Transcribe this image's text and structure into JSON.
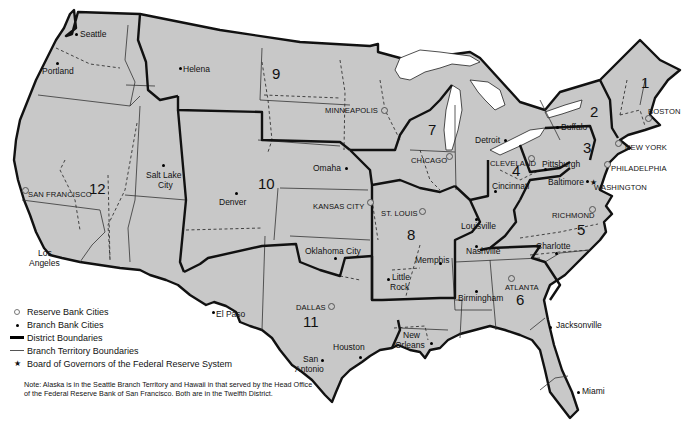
{
  "map": {
    "title": "Federal Reserve Districts",
    "fill_color": "#c8c8c8",
    "boundary_color": "#111111",
    "districts": [
      {
        "number": "1",
        "reserve_bank": "BOSTON"
      },
      {
        "number": "2",
        "reserve_bank": "NEW YORK"
      },
      {
        "number": "3",
        "reserve_bank": "PHILADELPHIA"
      },
      {
        "number": "4",
        "reserve_bank": "CLEVELAND"
      },
      {
        "number": "5",
        "reserve_bank": "RICHMOND"
      },
      {
        "number": "6",
        "reserve_bank": "ATLANTA"
      },
      {
        "number": "7",
        "reserve_bank": "CHICAGO"
      },
      {
        "number": "8",
        "reserve_bank": "ST. LOUIS"
      },
      {
        "number": "9",
        "reserve_bank": "MINNEAPOLIS"
      },
      {
        "number": "10",
        "reserve_bank": "KANSAS CITY"
      },
      {
        "number": "11",
        "reserve_bank": "DALLAS"
      },
      {
        "number": "12",
        "reserve_bank": "SAN FRANCISCO"
      }
    ],
    "board_of_governors": "WASHINGTON",
    "branch_cities": [
      "Seattle",
      "Portland",
      "Helena",
      "Salt Lake City",
      "Los Angeles",
      "Denver",
      "Omaha",
      "Oklahoma City",
      "El Paso",
      "San Antonio",
      "Houston",
      "Little Rock",
      "Memphis",
      "Louisville",
      "Nashville",
      "Birmingham",
      "New Orleans",
      "Jacksonville",
      "Miami",
      "Charlotte",
      "Baltimore",
      "Pittsburgh",
      "Cincinnati",
      "Detroit",
      "Buffalo"
    ],
    "labels": {
      "seattle": "Seattle",
      "portland": "Portland",
      "helena": "Helena",
      "salt_lake_1": "Salt Lake",
      "salt_lake_2": "City",
      "san_francisco": "SAN FRANCISCO",
      "los_angeles_1": "Los",
      "los_angeles_2": "Angeles",
      "denver": "Denver",
      "omaha": "Omaha",
      "kansas_city": "KANSAS CITY",
      "oklahoma_city": "Oklahoma City",
      "minneapolis": "MINNEAPOLIS",
      "chicago": "CHICAGO",
      "detroit": "Detroit",
      "st_louis": "ST. LOUIS",
      "louisville": "Louisville",
      "memphis": "Memphis",
      "little_rock_1": "Little",
      "little_rock_2": "Rock",
      "nashville": "Nashville",
      "cleveland": "CLEVELAND",
      "cincinnati": "Cincinnati",
      "pittsburgh": "Pittsburgh",
      "baltimore": "Baltimore",
      "washington": "WASHINGTON",
      "philadelphia": "PHILADELPHIA",
      "new_york": "NEW YORK",
      "boston": "BOSTON",
      "buffalo": "Buffalo",
      "richmond": "RICHMOND",
      "charlotte": "Charlotte",
      "atlanta": "ATLANTA",
      "birmingham": "Birmingham",
      "jacksonville": "Jacksonville",
      "miami": "Miami",
      "new_orleans_1": "New",
      "new_orleans_2": "Orleans",
      "dallas": "DALLAS",
      "el_paso": "El Paso",
      "san_antonio_1": "San",
      "san_antonio_2": "Antonio",
      "houston": "Houston"
    }
  },
  "legend": {
    "items": [
      {
        "symbol": "ring",
        "label": "Reserve Bank Cities"
      },
      {
        "symbol": "dot",
        "label": "Branch Bank Cities"
      },
      {
        "symbol": "thick-line",
        "label": "District Boundaries"
      },
      {
        "symbol": "thin-line",
        "label": "Branch Territory Boundaries"
      },
      {
        "symbol": "star",
        "label": "Board of Governors of the Federal Reserve System"
      }
    ],
    "star_glyph": "★",
    "note": "Note: Alaska is in the Seattle Branch Territory and Hawaii in that served by the Head Office of the Federal Reserve Bank of San Francisco. Both are in the Twelfth District."
  }
}
